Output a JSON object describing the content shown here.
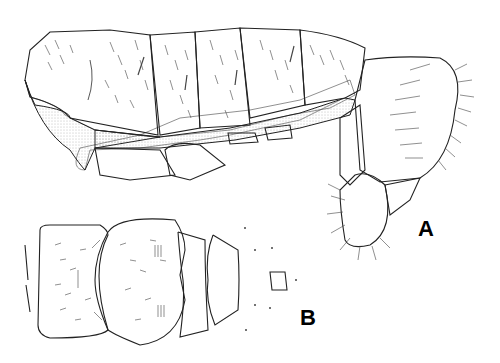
{
  "figure": {
    "panels": [
      {
        "id": "A",
        "label": "A",
        "description": "lateral view of abdomen with terminal genital segments"
      },
      {
        "id": "B",
        "label": "B",
        "description": "ventral view of abdominal sternites"
      }
    ]
  }
}
